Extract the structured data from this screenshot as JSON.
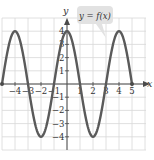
{
  "chart_data": {
    "type": "line",
    "title": "",
    "function_label": "y = f(x)",
    "xlabel": "x",
    "ylabel": "y",
    "xlim": [
      -5,
      5
    ],
    "ylim": [
      -4,
      4
    ],
    "x_ticks": [
      "-4",
      "-3",
      "-2",
      "-1",
      "1",
      "2",
      "3",
      "4",
      "5"
    ],
    "y_ticks": [
      "4",
      "3",
      "2",
      "1",
      "-1",
      "-2",
      "-3",
      "-4"
    ],
    "grid": true,
    "endpoints_marked": true,
    "series": [
      {
        "name": "f(x)",
        "x": [
          -5,
          -4,
          -3,
          -2,
          -1,
          0,
          1,
          2,
          3,
          4,
          5
        ],
        "values": [
          0,
          4,
          0,
          -4,
          0,
          4,
          0,
          -4,
          0,
          4,
          0
        ]
      }
    ],
    "curve_color": "#5a5a5a",
    "callout_color": "#e2e2e2"
  }
}
